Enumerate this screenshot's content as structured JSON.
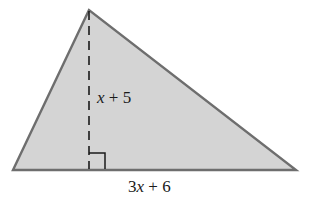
{
  "diagram": {
    "shape": "triangle",
    "fill_color": "#d4d4d4",
    "stroke_color": "#6e6e6e",
    "vertices": {
      "apex": [
        89,
        10
      ],
      "base_left": [
        13,
        170
      ],
      "base_right": [
        296,
        170
      ]
    },
    "height_label": {
      "variable": "x",
      "rest": " + 5"
    },
    "base_label": {
      "coef": "3",
      "variable": "x",
      "rest": " + 6"
    },
    "right_angle_marker": true,
    "height_line_style": "dashed"
  }
}
